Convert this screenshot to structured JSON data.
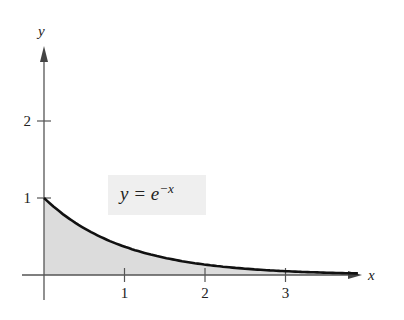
{
  "chart_data": {
    "type": "area",
    "title": "",
    "function": "y = e^{-x}",
    "label": {
      "lhs": "y",
      "eq": "=",
      "base": "e",
      "exponent": "−x"
    },
    "xlabel": "x",
    "ylabel": "y",
    "xticks": [
      "1",
      "2",
      "3"
    ],
    "yticks": [
      "1",
      "2"
    ],
    "xlim": [
      0,
      3.9
    ],
    "ylim": [
      0,
      2.8
    ],
    "x": [
      0,
      0.5,
      1,
      1.5,
      2,
      2.5,
      3,
      3.5,
      3.9
    ],
    "values": [
      1,
      0.607,
      0.368,
      0.223,
      0.135,
      0.082,
      0.05,
      0.03,
      0.02
    ],
    "fill_color": "#dcdcdc",
    "curve_color": "#111111"
  }
}
